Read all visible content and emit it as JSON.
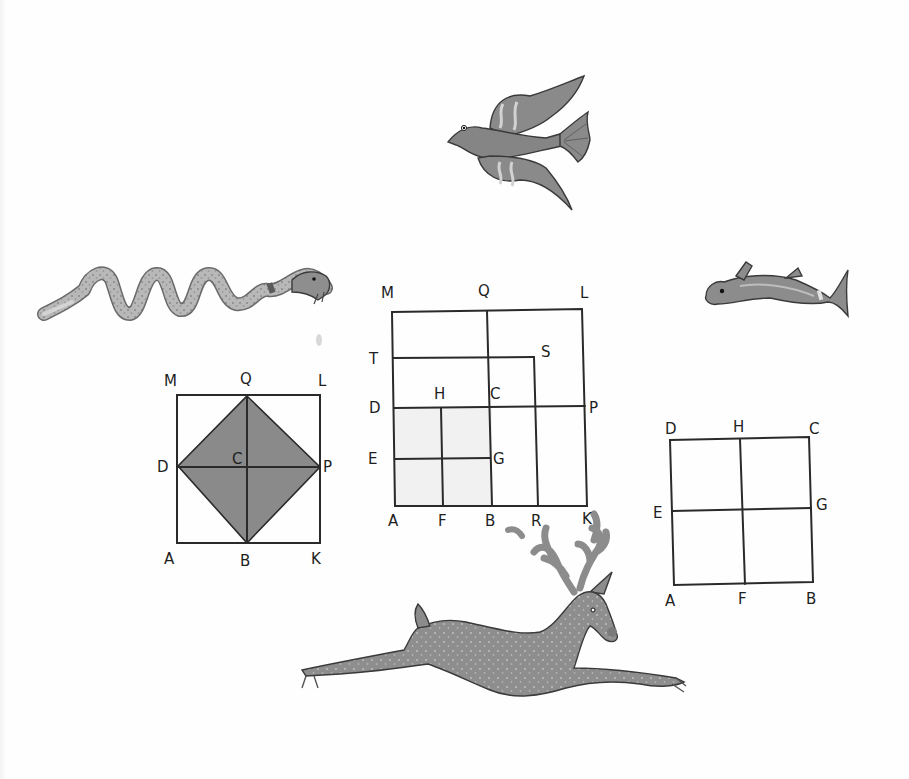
{
  "page": {
    "background": "#fefefe",
    "ink_color": "#2a2a2a",
    "fill_gray": "#8a8a8a",
    "animal_gray": "#8f8f8f"
  },
  "illustrations": {
    "bird": {
      "name": "bird",
      "description": "flying bird with spread wings"
    },
    "snake": {
      "name": "snake",
      "description": "serpent with wavy body"
    },
    "fish": {
      "name": "fish",
      "description": "dolphin-like fish"
    },
    "deer": {
      "name": "deer",
      "description": "leaping stag with antlers"
    }
  },
  "diagrams": {
    "left": {
      "title": "Square with inscribed diamond",
      "labels": {
        "M": "M",
        "Q": "Q",
        "L": "L",
        "D": "D",
        "C": "C",
        "P": "P",
        "A": "A",
        "B": "B",
        "K": "K"
      },
      "shaded": "DQPB"
    },
    "middle": {
      "title": "Nested squares gnomon",
      "labels": {
        "M": "M",
        "Q": "Q",
        "L": "L",
        "T": "T",
        "S": "S",
        "D": "D",
        "H": "H",
        "C": "C",
        "P": "P",
        "E": "E",
        "G": "G",
        "A": "A",
        "F": "F",
        "B": "B",
        "R": "R",
        "K": "K"
      },
      "shaded": "ADCB"
    },
    "right": {
      "title": "Square divided into four",
      "labels": {
        "D": "D",
        "H": "H",
        "C": "C",
        "E": "E",
        "G": "G",
        "A": "A",
        "F": "F",
        "B": "B"
      }
    }
  }
}
